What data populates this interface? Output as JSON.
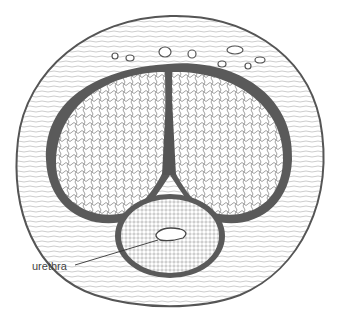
{
  "figure": {
    "labels": [
      {
        "text": "urethra",
        "x": 32,
        "y": 268
      }
    ],
    "caption_cropped": true,
    "colors": {
      "ink": "#5a5a5a",
      "dark_ink": "#444444",
      "paper": "#ffffff"
    }
  }
}
